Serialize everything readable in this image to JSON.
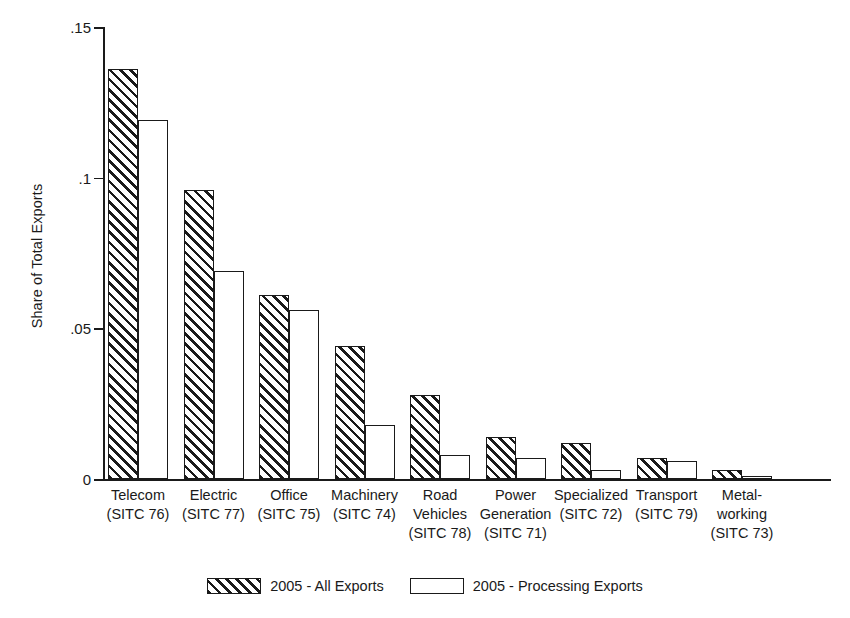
{
  "chart_data": {
    "type": "bar",
    "title": "",
    "xlabel": "",
    "ylabel": "Share of Total Exports",
    "ylim": [
      0,
      0.15
    ],
    "yticks": [
      0,
      0.05,
      0.1,
      0.15
    ],
    "ytick_labels": [
      "0",
      ".05",
      ".1",
      ".15"
    ],
    "grid": false,
    "legend_position": "bottom-center",
    "categories": [
      "Telecom",
      "Electric",
      "Office",
      "Machinery",
      "Road Vehicles",
      "Power Generation",
      "Specialized",
      "Transport",
      "Metal-working"
    ],
    "category_lines": [
      [
        "Telecom",
        "(SITC 76)"
      ],
      [
        "Electric",
        "(SITC 77)"
      ],
      [
        "Office",
        "(SITC 75)"
      ],
      [
        "Machinery",
        "(SITC 74)"
      ],
      [
        "Road",
        "Vehicles",
        "(SITC 78)"
      ],
      [
        "Power",
        "Generation",
        "(SITC 71)"
      ],
      [
        "Specialized",
        "(SITC 72)"
      ],
      [
        "Transport",
        "(SITC 79)"
      ],
      [
        "Metal-",
        "working",
        "(SITC 73)"
      ]
    ],
    "category_codes": [
      "(SITC 76)",
      "(SITC 77)",
      "(SITC 75)",
      "(SITC 74)",
      "(SITC 78)",
      "(SITC 71)",
      "(SITC 72)",
      "(SITC 79)",
      "(SITC 73)"
    ],
    "series": [
      {
        "name": "2005 - All Exports",
        "pattern": "hatched",
        "values": [
          0.136,
          0.096,
          0.061,
          0.044,
          0.028,
          0.014,
          0.012,
          0.007,
          0.003
        ]
      },
      {
        "name": "2005 - Processing Exports",
        "pattern": "open",
        "values": [
          0.119,
          0.069,
          0.056,
          0.018,
          0.008,
          0.007,
          0.003,
          0.006,
          0.001
        ]
      }
    ]
  },
  "legend": {
    "entries": [
      {
        "label": "2005 - All Exports",
        "pattern": "hatched"
      },
      {
        "label": "2005 - Processing Exports",
        "pattern": "open"
      }
    ]
  },
  "colors": {
    "ink": "#1a1a1a",
    "background": "#ffffff"
  }
}
